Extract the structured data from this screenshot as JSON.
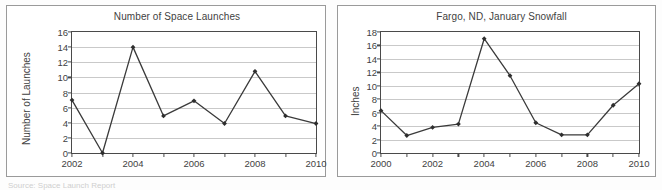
{
  "page": {
    "background_color": "#fdfdfd",
    "panel_border_color": "#9a9a9a",
    "axis_color": "#4a4a4a",
    "grid_color": "#c9c9c9",
    "series_color": "#3a3a3a",
    "marker_color": "#2e2e2e",
    "artifact_text": "Source: Space Launch Report"
  },
  "chart_data": [
    {
      "id": "space-launches",
      "type": "line",
      "title": "Number of Space Launches",
      "xlabel": "",
      "ylabel": "Number of Launches",
      "x": [
        2002,
        2003,
        2004,
        2005,
        2006,
        2007,
        2008,
        2009,
        2010
      ],
      "values": [
        7.0,
        0.0,
        14.0,
        4.9,
        6.9,
        3.9,
        10.8,
        4.9,
        3.9
      ],
      "xlim": [
        2002,
        2010
      ],
      "ylim": [
        0,
        16
      ],
      "ytick_values": [
        0,
        2,
        4,
        6,
        8,
        10,
        12,
        14,
        16
      ],
      "ytick_labels": [
        "0",
        "2",
        "4",
        "6",
        "8",
        "10",
        "12",
        "14",
        "16"
      ],
      "xtick_values": [
        2002,
        2003,
        2004,
        2005,
        2006,
        2007,
        2008,
        2009,
        2010
      ],
      "xtick_labels": [
        "2002",
        "",
        "2004",
        "",
        "2006",
        "",
        "2008",
        "",
        "2010"
      ],
      "grid": true,
      "grid_axis": "y",
      "legend": false,
      "markers": "diamond"
    },
    {
      "id": "fargo-snowfall",
      "type": "line",
      "title": "Fargo, ND, January Snowfall",
      "xlabel": "",
      "ylabel": "Inches",
      "x": [
        2000,
        2001,
        2002,
        2003,
        2004,
        2005,
        2006,
        2007,
        2008,
        2009,
        2010
      ],
      "values": [
        6.3,
        2.6,
        3.8,
        4.3,
        17.0,
        11.5,
        4.5,
        2.7,
        2.7,
        7.1,
        10.3
      ],
      "xlim": [
        2000,
        2010
      ],
      "ylim": [
        0,
        18
      ],
      "ytick_values": [
        0,
        2,
        4,
        6,
        8,
        10,
        12,
        14,
        16,
        18
      ],
      "ytick_labels": [
        "0",
        "2",
        "4",
        "6",
        "8",
        "10",
        "12",
        "14",
        "16",
        "18"
      ],
      "xtick_values": [
        2000,
        2001,
        2002,
        2003,
        2004,
        2005,
        2006,
        2007,
        2008,
        2009,
        2010
      ],
      "xtick_labels": [
        "2000",
        "",
        "2002",
        "",
        "2004",
        "",
        "2006",
        "",
        "2008",
        "",
        "2010"
      ],
      "grid": true,
      "grid_axis": "y",
      "legend": false,
      "markers": "diamond"
    }
  ]
}
